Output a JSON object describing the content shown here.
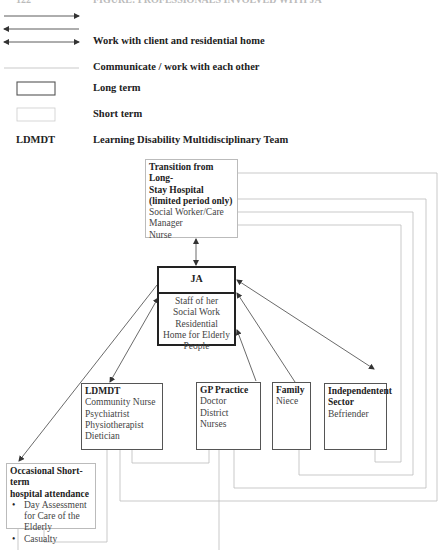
{
  "header": {
    "cut_left": "122",
    "cut_title": "FIGURE: PROFESSIONALS INVOLVED WITH JA"
  },
  "legend": {
    "items": [
      {
        "symbol": "single-arrow-right",
        "label": ""
      },
      {
        "symbol": "single-arrow-left",
        "label": ""
      },
      {
        "symbol": "double-arrow",
        "label": "Work with client and residential home"
      },
      {
        "symbol": "dotted-line",
        "label": "Communicate / work with each other"
      },
      {
        "symbol": "dark-box",
        "label": "Long term"
      },
      {
        "symbol": "light-box",
        "label": "Short term"
      }
    ],
    "abbreviation": {
      "abbr": "LDMDT",
      "meaning": "Learning Disability Multidisciplinary Team"
    }
  },
  "nodes": {
    "transition": {
      "title_lines": [
        "Transition from Long-",
        "Stay Hospital",
        "(limited period only)"
      ],
      "members": [
        "Social Worker/Care",
        "Manager",
        "Nurse"
      ],
      "term": "short"
    },
    "ja": {
      "title": "JA",
      "body": "Staff of her Social Work Residential Home for Elderly People",
      "term": "long"
    },
    "ldmdt": {
      "title": "LDMDT",
      "members": [
        "Community Nurse",
        "Psychiatrist",
        "Physiotherapist",
        "Dietician"
      ],
      "term": "long"
    },
    "gp": {
      "title": "GP Practice",
      "members": [
        "Doctor",
        "District Nurses"
      ],
      "term": "long"
    },
    "family": {
      "title": "Family",
      "members": [
        "Niece"
      ],
      "term": "long"
    },
    "independent": {
      "title_lines": [
        "Independentent",
        "Sector"
      ],
      "members": [
        "Befriender"
      ],
      "term": "long"
    },
    "occasional": {
      "title_lines": [
        "Occasional Short-term",
        "hospital attendance"
      ],
      "bullets": [
        "Day Assessment for Care of the Elderly",
        "Casualty"
      ],
      "term": "short"
    }
  },
  "colors": {
    "arrow": "#444444",
    "dotted": "#bbbbbb",
    "long_border": "#555555",
    "short_border": "#bbbbbb"
  }
}
